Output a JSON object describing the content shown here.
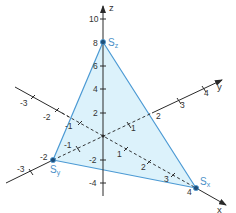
{
  "diagram": {
    "colors": {
      "plane_fill": "#d6f0fa",
      "plane_edge": "#4c9ad4",
      "axis": "#2a2a2a",
      "point_label": "#4a8fc8"
    },
    "axes": {
      "x": {
        "name": "x",
        "ticks": [
          "-3",
          "-2",
          "-1",
          "1",
          "2",
          "3",
          "4"
        ]
      },
      "y": {
        "name": "y",
        "ticks": [
          "-3",
          "-2",
          "-1",
          "1",
          "2",
          "3",
          "4"
        ]
      },
      "z": {
        "name": "z",
        "ticks": [
          "-4",
          "-2",
          "2",
          "4",
          "6",
          "8",
          "10"
        ]
      }
    },
    "points": {
      "sx": {
        "label": "S",
        "sub": "x",
        "coords": "(4|0|0)"
      },
      "sy": {
        "label": "S",
        "sub": "y",
        "coords": "(0|-2|0)"
      },
      "sz": {
        "label": "S",
        "sub": "z",
        "coords": "(0|0|8)"
      }
    },
    "labels": {
      "x_neg3": "-3",
      "x_neg2": "-2",
      "x_neg1": "-1",
      "x_1": "1",
      "x_2": "2",
      "x_3": "3",
      "x_4": "4",
      "y_neg3": "-3",
      "y_neg2": "-2",
      "y_neg1": "-1",
      "y_1": "1",
      "y_2": "2",
      "y_3": "3",
      "y_4": "4",
      "z_neg4": "-4",
      "z_neg2": "-2",
      "z_2": "2",
      "z_4": "4",
      "z_6": "6",
      "z_8": "8",
      "z_10": "10"
    }
  }
}
